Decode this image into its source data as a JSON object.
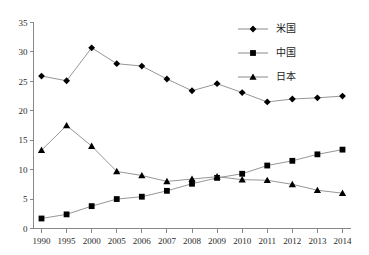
{
  "chart_data": {
    "type": "line",
    "title": "",
    "xlabel": "",
    "ylabel": "",
    "ylim": [
      0,
      35
    ],
    "ytick_step": 5,
    "grid": false,
    "legend_position": "top-right",
    "categories": [
      "1990",
      "1995",
      "2000",
      "2005",
      "2006",
      "2007",
      "2008",
      "2009",
      "2010",
      "2011",
      "2012",
      "2013",
      "2014"
    ],
    "yticks": [
      "0",
      "5",
      "10",
      "15",
      "20",
      "25",
      "30",
      "35"
    ],
    "series": [
      {
        "name": "米国",
        "marker": "diamond",
        "values": [
          25.9,
          25.1,
          30.7,
          28.0,
          27.6,
          25.4,
          23.4,
          24.6,
          23.1,
          21.5,
          22.0,
          22.2,
          22.5
        ]
      },
      {
        "name": "中国",
        "marker": "square",
        "values": [
          1.7,
          2.4,
          3.8,
          5.0,
          5.4,
          6.4,
          7.6,
          8.6,
          9.3,
          10.7,
          11.5,
          12.6,
          13.4
        ]
      },
      {
        "name": "日本",
        "marker": "triangle",
        "values": [
          13.3,
          17.5,
          14.0,
          9.7,
          9.0,
          8.0,
          8.4,
          8.8,
          8.3,
          8.2,
          7.5,
          6.5,
          6.0
        ]
      }
    ]
  },
  "legend": {
    "entries": [
      {
        "label": "米国",
        "marker": "diamond"
      },
      {
        "label": "中国",
        "marker": "square"
      },
      {
        "label": "日本",
        "marker": "triangle"
      }
    ]
  }
}
